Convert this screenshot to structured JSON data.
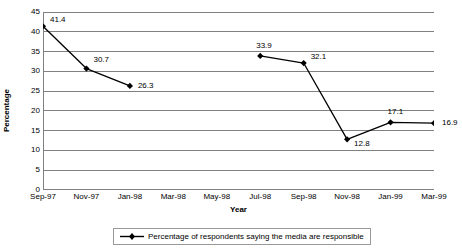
{
  "chart_data": {
    "type": "line",
    "title": "",
    "xlabel": "Year",
    "ylabel": "Percentage",
    "categories": [
      "Sep-97",
      "Nov-97",
      "Jan-98",
      "Mar-98",
      "May-98",
      "Jul-98",
      "Sep-98",
      "Nov-98",
      "Jan-99",
      "Mar-99"
    ],
    "series": [
      {
        "name": "Percentage of respondents saying the media are responsible",
        "values": [
          41.4,
          30.7,
          26.3,
          null,
          null,
          33.9,
          32.1,
          12.8,
          17.1,
          16.9
        ]
      }
    ],
    "point_labels": [
      "41.4",
      "30.7",
      "26.3",
      "",
      "",
      "33.9",
      "32.1",
      "12.8",
      "17.1",
      "16.9"
    ],
    "ylim": [
      0,
      45
    ],
    "yticks": [
      "0",
      "5",
      "10",
      "15",
      "20",
      "25",
      "30",
      "35",
      "40",
      "45"
    ],
    "grid": "horizontal",
    "legend_position": "bottom",
    "marker": "diamond",
    "line_color": "#000000",
    "grid_color": "#808080",
    "axis_color": "#808080"
  },
  "axes": {
    "y_title": "Percentage",
    "x_title": "Year"
  },
  "legend": {
    "entries": [
      {
        "label": "Percentage of respondents saying the media are responsible"
      }
    ]
  }
}
